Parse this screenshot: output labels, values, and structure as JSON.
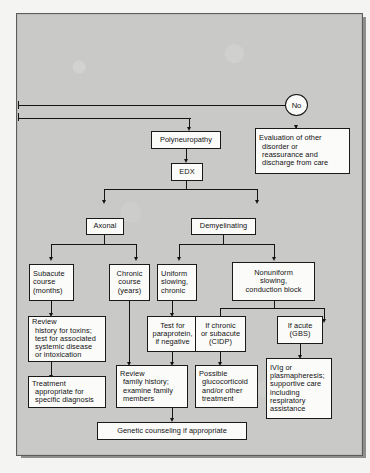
{
  "figure": {
    "kind": "clinical-algorithm-flowchart",
    "colors": {
      "panel_background": "#c9c9c7",
      "panel_border": "#5d5d5d",
      "box_fill": "#fbfbfa",
      "box_border": "#1a1a1a",
      "connector": "#141414",
      "page_background": "#f4f4f2",
      "shadow": "#8e8e8e"
    }
  },
  "nodes": {
    "decision_no": {
      "label": "No"
    },
    "evaluation_other": {
      "lines": [
        "Evaluation of other",
        "disorder or",
        "reassurance and",
        "discharge from care"
      ]
    },
    "polyneuropathy": {
      "lines": [
        "Polyneuropathy"
      ]
    },
    "edx": {
      "lines": [
        "EDX"
      ]
    },
    "axonal": {
      "lines": [
        "Axonal"
      ]
    },
    "demyelinating": {
      "lines": [
        "Demyelinating"
      ]
    },
    "subacute_course": {
      "lines": [
        "Subacute",
        "course",
        "(months)"
      ]
    },
    "chronic_course": {
      "lines": [
        "Chronic",
        "course",
        "(years)"
      ]
    },
    "uniform_slowing": {
      "lines": [
        "Uniform",
        "slowing,",
        "chronic"
      ]
    },
    "nonuniform_slowing": {
      "lines": [
        "Nonuniform",
        "slowing,",
        "conduction block"
      ]
    },
    "review_history_toxins": {
      "lines": [
        "Review",
        "history for toxins;",
        "test for associated",
        "systemic disease",
        "or intoxication"
      ]
    },
    "test_paraprotein": {
      "lines": [
        "Test for",
        "paraprotein,",
        "if negative"
      ]
    },
    "if_chronic_subacute": {
      "lines": [
        "If chronic",
        "or subacute",
        "(CIDP)"
      ]
    },
    "if_acute": {
      "lines": [
        "If acute",
        "(GBS)"
      ]
    },
    "treatment_specific": {
      "lines": [
        "Treatment",
        "appropriate for",
        "specific diagnosis"
      ]
    },
    "review_family_history": {
      "lines": [
        "Review",
        "family history;",
        "examine family",
        "members"
      ]
    },
    "possible_glucocorticoid": {
      "lines": [
        "Possible",
        "glucocorticoid",
        "and/or other",
        "treatment"
      ]
    },
    "ivig_plasmapheresis": {
      "lines": [
        "IVIg or",
        "plasmapheresis;",
        "supportive care",
        "including",
        "respiratory",
        "assistance"
      ]
    },
    "genetic_counseling": {
      "lines": [
        "Genetic counseling if appropriate"
      ]
    }
  }
}
